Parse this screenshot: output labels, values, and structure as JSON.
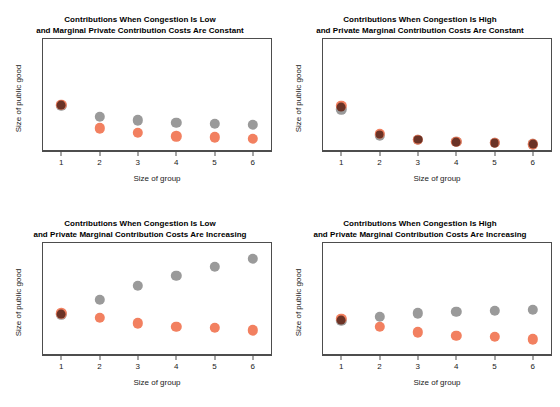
{
  "figure": {
    "background": "#ffffff",
    "width": 560,
    "height": 407,
    "colors": {
      "gray_series": "#9a9a9a",
      "orange_series": "#f28060",
      "overlap": "#6b3326",
      "frame": "#4d4d4d",
      "text": "#000000"
    }
  },
  "chart_data": [
    {
      "id": "panel-top-left",
      "type": "scatter",
      "title": "Contributions When Congestion Is Low\nand Marginal Private Contribution Costs Are Constant",
      "title_line1": "Contributions When Congestion Is Low",
      "title_line2": "and Marginal Private Contribution Costs Are Constant",
      "xlabel": "Size of group",
      "ylabel": "Size of public good",
      "categories": [
        1,
        2,
        3,
        4,
        5,
        6
      ],
      "xticklabels": [
        "1",
        "2",
        "3",
        "4",
        "5",
        "6"
      ],
      "yticklabels": [],
      "grid": false,
      "legend": "none",
      "xlim": [
        0.5,
        6.5
      ],
      "ylim": [
        0,
        1
      ],
      "series": [
        {
          "name": "gray",
          "color": "#9a9a9a",
          "values": [
            0.4,
            0.3,
            0.27,
            0.25,
            0.24,
            0.23
          ]
        },
        {
          "name": "orange",
          "color": "#f28060",
          "values": [
            0.41,
            0.2,
            0.16,
            0.13,
            0.12,
            0.11
          ]
        }
      ],
      "overlap_points": [
        1
      ]
    },
    {
      "id": "panel-top-right",
      "type": "scatter",
      "title": "Contributions When Congestion Is High\nand Private Marginal Contribution Costs Are Constant",
      "title_line1": "Contributions When Congestion Is High",
      "title_line2": "and Private Marginal Contribution Costs Are Constant",
      "xlabel": "Size of group",
      "ylabel": "Size of public good",
      "categories": [
        1,
        2,
        3,
        4,
        5,
        6
      ],
      "xticklabels": [
        "1",
        "2",
        "3",
        "4",
        "5",
        "6"
      ],
      "yticklabels": [],
      "grid": false,
      "legend": "none",
      "xlim": [
        0.5,
        6.5
      ],
      "ylim": [
        0,
        1
      ],
      "series": [
        {
          "name": "gray",
          "color": "#9a9a9a",
          "values": [
            0.37,
            0.14,
            0.1,
            0.08,
            0.07,
            0.06
          ]
        },
        {
          "name": "orange",
          "color": "#f28060",
          "values": [
            0.4,
            0.15,
            0.1,
            0.08,
            0.07,
            0.06
          ]
        }
      ],
      "overlap_points": [
        1,
        2,
        3,
        4,
        5,
        6
      ]
    },
    {
      "id": "panel-bottom-left",
      "type": "scatter",
      "title": "Contributions When Congestion Is Low\nand Private Marginal Contribution Costs Are Increasing",
      "title_line1": "Contributions When Congestion Is Low",
      "title_line2": "and Private Marginal Contribution Costs Are Increasing",
      "xlabel": "Size of group",
      "ylabel": "Size of public good",
      "categories": [
        1,
        2,
        3,
        4,
        5,
        6
      ],
      "xticklabels": [
        "1",
        "2",
        "3",
        "4",
        "5",
        "6"
      ],
      "yticklabels": [],
      "grid": false,
      "legend": "none",
      "xlim": [
        0.5,
        6.5
      ],
      "ylim": [
        0,
        1
      ],
      "series": [
        {
          "name": "gray",
          "color": "#9a9a9a",
          "values": [
            0.36,
            0.49,
            0.61,
            0.7,
            0.78,
            0.85
          ]
        },
        {
          "name": "orange",
          "color": "#f28060",
          "values": [
            0.37,
            0.33,
            0.28,
            0.25,
            0.24,
            0.22
          ]
        }
      ],
      "overlap_points": [
        1
      ]
    },
    {
      "id": "panel-bottom-right",
      "type": "scatter",
      "title": "Contributions When Congestion Is High\nand Private Marginal Contribution Costs Are Increasing",
      "title_line1": "Contributions When Congestion Is High",
      "title_line2": "and Private Marginal Contribution Costs Are Increasing",
      "xlabel": "Size of group",
      "ylabel": "Size of public good",
      "categories": [
        1,
        2,
        3,
        4,
        5,
        6
      ],
      "xticklabels": [
        "1",
        "2",
        "3",
        "4",
        "5",
        "6"
      ],
      "yticklabels": [],
      "grid": false,
      "legend": "none",
      "xlim": [
        0.5,
        6.5
      ],
      "ylim": [
        0,
        1
      ],
      "series": [
        {
          "name": "gray",
          "color": "#9a9a9a",
          "values": [
            0.3,
            0.34,
            0.37,
            0.38,
            0.39,
            0.4
          ]
        },
        {
          "name": "orange",
          "color": "#f28060",
          "values": [
            0.32,
            0.25,
            0.2,
            0.17,
            0.16,
            0.14
          ]
        }
      ],
      "overlap_points": [
        1
      ]
    }
  ]
}
